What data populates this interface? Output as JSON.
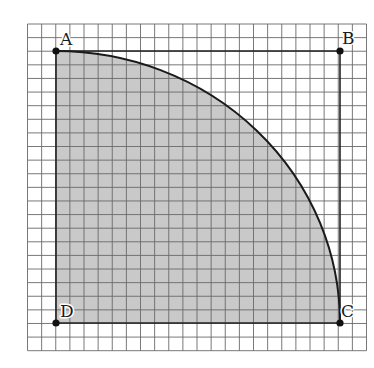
{
  "figure": {
    "grid": {
      "columns": 24,
      "rows": 24
    },
    "square": {
      "corners": [
        "A",
        "B",
        "C",
        "D"
      ]
    },
    "sector": {
      "center": "D",
      "from": "A",
      "to": "C",
      "shaded": true
    },
    "colors": {
      "background": "#ffffff",
      "grid_line": "#6a6a6a",
      "fill": "#c9c9c9",
      "outline": "#222222",
      "point": "#111111"
    }
  },
  "points": [
    {
      "name": "A",
      "label": "A"
    },
    {
      "name": "B",
      "label": "B"
    },
    {
      "name": "C",
      "label": "C"
    },
    {
      "name": "D",
      "label": "D"
    }
  ]
}
